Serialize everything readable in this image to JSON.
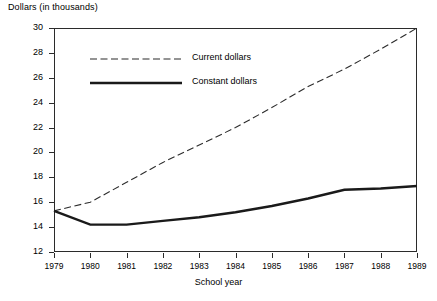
{
  "chart_data": {
    "type": "line",
    "title": "Dollars (in thousands)",
    "ylabel": "Dollars (in thousands)",
    "xlabel": "School year",
    "x": [
      1979,
      1980,
      1981,
      1982,
      1983,
      1984,
      1985,
      1986,
      1987,
      1988,
      1989
    ],
    "xtick_labels": [
      "1979",
      "1980",
      "1981",
      "1982",
      "1983",
      "1984",
      "1985",
      "1986",
      "1987",
      "1988",
      "1989"
    ],
    "ytick_labels": [
      "12",
      "14",
      "16",
      "18",
      "20",
      "22",
      "24",
      "26",
      "28",
      "30"
    ],
    "yticks": [
      12,
      14,
      16,
      18,
      20,
      22,
      24,
      26,
      28,
      30
    ],
    "ylim": [
      12,
      30
    ],
    "xlim": [
      1979,
      1989
    ],
    "grid": false,
    "legend_position": "upper-left-inside",
    "series": [
      {
        "name": "Current dollars",
        "style": "dashed",
        "color": "#2b2b2b",
        "values": [
          15.3,
          16.0,
          17.6,
          19.2,
          20.6,
          22.0,
          23.6,
          25.3,
          26.7,
          28.3,
          30.0
        ]
      },
      {
        "name": "Constant dollars",
        "style": "solid",
        "color": "#1a1a1a",
        "values": [
          15.3,
          14.2,
          14.2,
          14.5,
          14.8,
          15.2,
          15.7,
          16.3,
          17.0,
          17.1,
          17.3
        ]
      }
    ]
  },
  "legend": {
    "items": [
      {
        "label": "Current dollars",
        "style": "dashed"
      },
      {
        "label": "Constant dollars",
        "style": "solid"
      }
    ]
  }
}
